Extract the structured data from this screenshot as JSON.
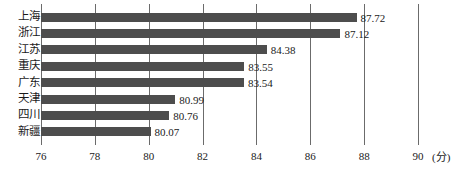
{
  "chart_data": {
    "type": "bar",
    "orientation": "horizontal",
    "title": "",
    "subtitle": "",
    "xlabel": "(分)",
    "ylabel": "",
    "xlim": [
      76,
      90
    ],
    "ylim": null,
    "grid": true,
    "legend": null,
    "legend_position": "none",
    "xticks": [
      "76",
      "78",
      "80",
      "82",
      "84",
      "86",
      "88",
      "90"
    ],
    "xtick_values": [
      76,
      78,
      80,
      82,
      84,
      86,
      88,
      90
    ],
    "categories": [
      "上海",
      "浙江",
      "江苏",
      "重庆",
      "广东",
      "天津",
      "四川",
      "新疆"
    ],
    "values": [
      87.72,
      87.12,
      84.38,
      83.55,
      83.54,
      80.99,
      80.76,
      80.07
    ],
    "value_labels": [
      "87.72",
      "87.12",
      "84.38",
      "83.55",
      "83.54",
      "80.99",
      "80.76",
      "80.07"
    ],
    "bar_color": "#4d4d4d",
    "grid_color": "#6b6b6b",
    "background_color": "#ffffff",
    "annotations": []
  },
  "axis": {
    "unit_label": "(分)"
  }
}
